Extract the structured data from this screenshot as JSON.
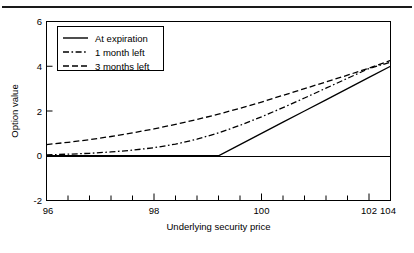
{
  "figure": {
    "has_top_rule": true,
    "background": "#ffffff",
    "ink_color": "#000000"
  },
  "chart_data": {
    "type": "line",
    "title": "",
    "xlabel": "Underlying security price",
    "ylabel": "Option value",
    "xlim": [
      96,
      104
    ],
    "ylim": [
      -2,
      6
    ],
    "xticks": [
      96,
      98,
      100,
      102,
      104
    ],
    "xticklabels": [
      "96",
      "98",
      "100",
      "102",
      "104"
    ],
    "yticks": [
      -2,
      0,
      2,
      4,
      6
    ],
    "yticklabels": [
      "-2",
      "0",
      "2",
      "4",
      "6"
    ],
    "minor_xtick_step": 0.5,
    "grid": false,
    "zero_reference_line": true,
    "legend": {
      "position": "upper-left",
      "entries": [
        {
          "label": "At expiration",
          "style": "solid"
        },
        {
          "label": "1 month left",
          "style": "dashdot"
        },
        {
          "label": "3 months left",
          "style": "dashed"
        }
      ]
    },
    "x": [
      96,
      96.5,
      97,
      97.5,
      98,
      98.5,
      99,
      99.5,
      100,
      100.5,
      101,
      101.5,
      102,
      102.5,
      103,
      103.5,
      104
    ],
    "series": [
      {
        "name": "At expiration",
        "style": "solid",
        "values": [
          0,
          0,
          0,
          0,
          0,
          0,
          0,
          0,
          0,
          0.5,
          1,
          1.5,
          2,
          2.5,
          3,
          3.5,
          4
        ]
      },
      {
        "name": "1 month left",
        "style": "dashdot",
        "values": [
          0.04,
          0.07,
          0.11,
          0.17,
          0.25,
          0.36,
          0.52,
          0.74,
          1.02,
          1.36,
          1.74,
          2.15,
          2.58,
          3.02,
          3.46,
          3.9,
          4.18
        ]
      },
      {
        "name": "3 months left",
        "style": "dashed",
        "values": [
          0.5,
          0.6,
          0.72,
          0.86,
          1.02,
          1.2,
          1.4,
          1.62,
          1.86,
          2.12,
          2.4,
          2.7,
          3.0,
          3.3,
          3.6,
          3.92,
          4.26
        ]
      }
    ]
  }
}
